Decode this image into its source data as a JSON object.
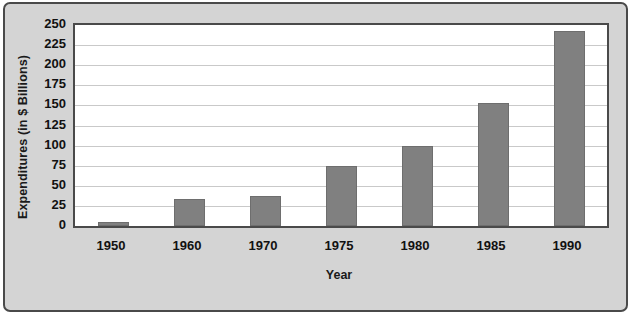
{
  "chart_data": {
    "type": "bar",
    "title": "",
    "xlabel": "Year",
    "ylabel": "Expenditures (in $ Billions)",
    "categories": [
      "1950",
      "1960",
      "1970",
      "1975",
      "1980",
      "1985",
      "1990"
    ],
    "values": [
      5,
      33,
      37,
      75,
      100,
      153,
      242
    ],
    "ylim": [
      0,
      250
    ],
    "ytick_labels": [
      "0",
      "25",
      "50",
      "75",
      "100",
      "125",
      "150",
      "175",
      "200",
      "225",
      "250"
    ],
    "ytick_values": [
      0,
      25,
      50,
      75,
      100,
      125,
      150,
      175,
      200,
      225,
      250
    ],
    "grid": true,
    "legend": "none",
    "colors": {
      "bar": "#808080",
      "bar_edge": "#6e6e6e",
      "plot_background": "#ffffff",
      "figure_background": "#d4d4d4",
      "frame_border": "#4a4a4a",
      "gridline": "#c9c9c9",
      "text": "#111111"
    }
  }
}
